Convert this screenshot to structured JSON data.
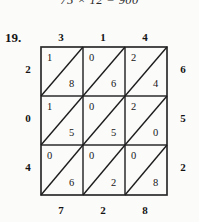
{
  "page": {
    "previous_equation": "75 × 12 = 900",
    "problem_number": "19."
  },
  "lattice": {
    "top_factors": [
      "3",
      "1",
      "4"
    ],
    "left_factors": [
      "2",
      "0",
      "4"
    ],
    "right_sums": [
      "6",
      "5",
      "2"
    ],
    "bottom_sums": [
      "7",
      "2",
      "8"
    ],
    "cells": [
      [
        {
          "upper": "1",
          "lower": "8"
        },
        {
          "upper": "0",
          "lower": "6"
        },
        {
          "upper": "2",
          "lower": "4"
        }
      ],
      [
        {
          "upper": "1",
          "lower": "5"
        },
        {
          "upper": "0",
          "lower": "5"
        },
        {
          "upper": "2",
          "lower": "0"
        }
      ],
      [
        {
          "upper": "0",
          "lower": "6"
        },
        {
          "upper": "0",
          "lower": "2"
        },
        {
          "upper": "0",
          "lower": "8"
        }
      ]
    ],
    "colors": {
      "ink": "#161616",
      "rule": "#2b2b2b",
      "paper": "#fbfbfa"
    }
  }
}
